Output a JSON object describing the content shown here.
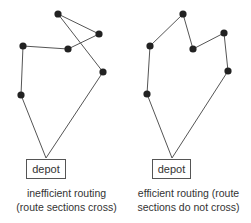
{
  "colors": {
    "line": "#555555",
    "node": "#222222",
    "text": "#333333"
  },
  "diagrams": [
    {
      "id": "inefficient",
      "depot_label": "depot",
      "caption_line1": "inefficient routing",
      "caption_line2": "(route sections cross)",
      "depot_apex": [
        46,
        158
      ],
      "depot_box": {
        "x": 26,
        "y": 159,
        "w": 40,
        "h": 20
      },
      "route": [
        [
          21,
          95
        ],
        [
          23,
          46
        ],
        [
          68,
          49
        ],
        [
          99,
          34
        ],
        [
          58,
          14
        ],
        [
          103,
          72
        ]
      ]
    },
    {
      "id": "efficient",
      "depot_label": "depot",
      "caption_line1": "efficient routing (route",
      "caption_line2": "sections do not cross)",
      "depot_apex": [
        172,
        158
      ],
      "depot_box": {
        "x": 152,
        "y": 159,
        "w": 39,
        "h": 20
      },
      "route": [
        [
          147,
          94
        ],
        [
          150,
          46
        ],
        [
          183,
          14
        ],
        [
          193,
          49
        ],
        [
          224,
          33
        ],
        [
          228,
          71
        ]
      ]
    }
  ]
}
